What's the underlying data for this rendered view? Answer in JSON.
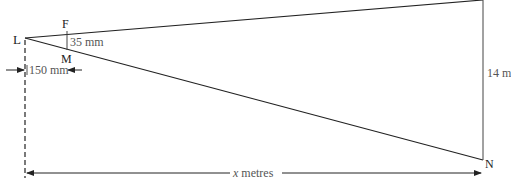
{
  "diagram": {
    "points": {
      "L": "L",
      "F": "F",
      "M": "M",
      "N": "N"
    },
    "dimensions": {
      "FM": "35 mm",
      "L_to_FM": "150 mm",
      "right_side": "14 m",
      "base_x_italic": "x",
      "base_unit": " metres"
    },
    "colors": {
      "line": "#222222",
      "dimension_text": "#555555"
    }
  }
}
